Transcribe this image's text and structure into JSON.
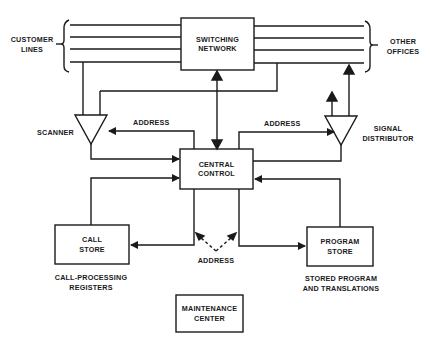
{
  "diagram": {
    "nodes": {
      "switching_network": {
        "line1": "SWITCHING",
        "line2": "NETWORK"
      },
      "central_control": {
        "line1": "CENTRAL",
        "line2": "CONTROL"
      },
      "call_store": {
        "line1": "CALL",
        "line2": "STORE"
      },
      "program_store": {
        "line1": "PROGRAM",
        "line2": "STORE"
      },
      "maintenance_center": {
        "line1": "MAINTENANCE",
        "line2": "CENTER"
      },
      "scanner": {
        "label": "SCANNER"
      },
      "signal_distributor": {
        "line1": "SIGNAL",
        "line2": "DISTRIBUTOR"
      }
    },
    "labels": {
      "customer_lines": {
        "line1": "CUSTOMER",
        "line2": "LINES"
      },
      "other_offices": {
        "line1": "OTHER",
        "line2": "OFFICES"
      },
      "address_scanner": "ADDRESS",
      "address_distributor": "ADDRESS",
      "address_stores": "ADDRESS",
      "call_store_caption": {
        "line1": "CALL-PROCESSING",
        "line2": "REGISTERS"
      },
      "program_store_caption": {
        "line1": "STORED PROGRAM",
        "line2": "AND TRANSLATIONS"
      }
    },
    "colors": {
      "stroke": "#1a1a1a",
      "background": "#ffffff"
    }
  }
}
